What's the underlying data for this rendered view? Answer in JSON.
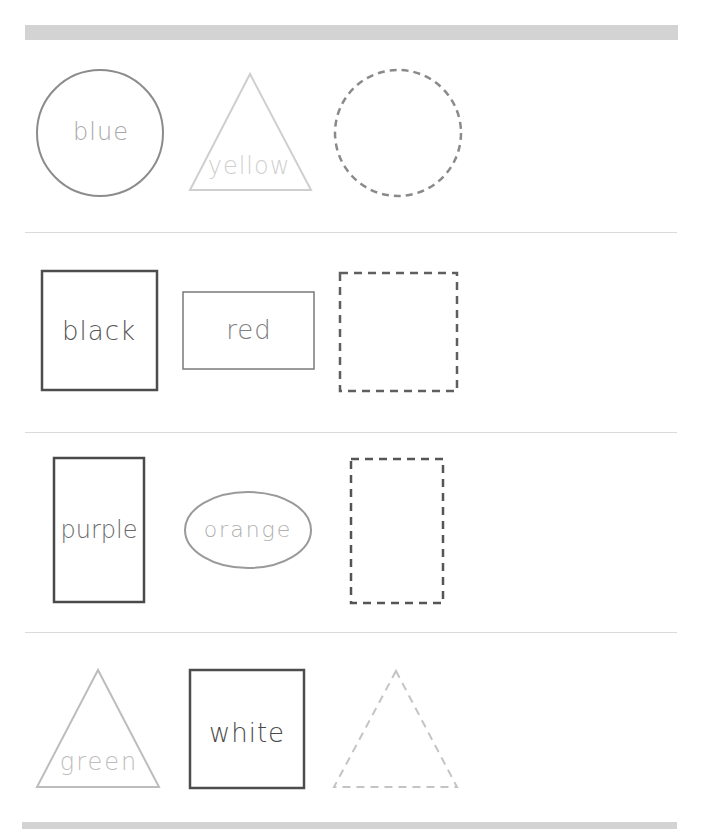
{
  "worksheet": {
    "rows": [
      {
        "shapes": [
          {
            "kind": "circle",
            "label": "blue",
            "style": "solid",
            "stroke": "#8c8c8c",
            "text_color": "#a8a8a8"
          },
          {
            "kind": "triangle",
            "label": "yellow",
            "style": "solid",
            "stroke": "#cfcfcf",
            "text_color": "#d0d0d0"
          },
          {
            "kind": "circle",
            "label": "",
            "style": "dashed",
            "stroke": "#8a8a8a"
          }
        ]
      },
      {
        "shapes": [
          {
            "kind": "square",
            "label": "black",
            "style": "solid",
            "stroke": "#4d4d4d",
            "text_color": "#555555"
          },
          {
            "kind": "rectangle",
            "label": "red",
            "style": "solid",
            "stroke": "#7a7a7a",
            "text_color": "#808080"
          },
          {
            "kind": "square",
            "label": "",
            "style": "dashed",
            "stroke": "#5f5f5f"
          }
        ]
      },
      {
        "shapes": [
          {
            "kind": "rectangle-tall",
            "label": "purple",
            "style": "solid",
            "stroke": "#4a4a4a",
            "text_color": "#6a6a6a"
          },
          {
            "kind": "oval",
            "label": "orange",
            "style": "solid",
            "stroke": "#9a9a9a",
            "text_color": "#b0b0b0"
          },
          {
            "kind": "rectangle-tall",
            "label": "",
            "style": "dashed",
            "stroke": "#555555"
          }
        ]
      },
      {
        "shapes": [
          {
            "kind": "triangle",
            "label": "green",
            "style": "solid",
            "stroke": "#bdbdbd",
            "text_color": "#bdbdbd"
          },
          {
            "kind": "square",
            "label": "white",
            "style": "solid",
            "stroke": "#4d4d4d",
            "text_color": "#4a4a4a"
          },
          {
            "kind": "triangle",
            "label": "",
            "style": "dashed",
            "stroke": "#c4c4c4"
          }
        ]
      }
    ],
    "colors": {
      "bar": "#d3d3d3",
      "separator": "#dadada",
      "background": "#ffffff"
    }
  }
}
